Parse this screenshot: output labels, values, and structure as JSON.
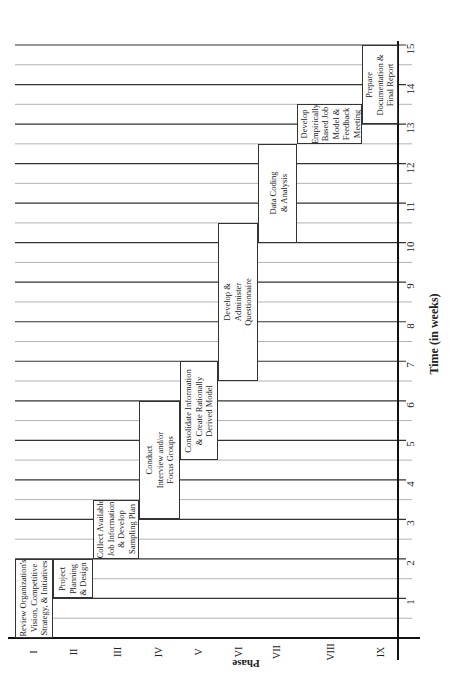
{
  "chart_data": {
    "type": "gantt",
    "orientation": "rotated 90° (time axis vertical on right, phases along bottom)",
    "title": "",
    "xlabel": "Phase",
    "ylabel": "Time (in weeks)",
    "time_range": [
      0,
      15
    ],
    "time_ticks": [
      "1",
      "2",
      "3",
      "4",
      "5",
      "6",
      "7",
      "8",
      "9",
      "10",
      "11",
      "12",
      "13",
      "14",
      "15"
    ],
    "grid": {
      "major_every_weeks": 1,
      "minor_every_weeks": 0.5
    },
    "categories": [
      "I",
      "II",
      "III",
      "IV",
      "V",
      "VI",
      "VII",
      "VIII",
      "IX"
    ],
    "tasks": [
      {
        "phase": "I",
        "label": "Review Organization's\nVision, Competitive\nStrategy, & Initiatives",
        "start": 0,
        "end": 2
      },
      {
        "phase": "II",
        "label": "Project\nPlanning\n& Design",
        "start": 1,
        "end": 2
      },
      {
        "phase": "III",
        "label": "Collect Available\nJob Information\n& Develop\nSampling Plan",
        "start": 2,
        "end": 3.5
      },
      {
        "phase": "IV",
        "label": "Conduct\nInterview and/or\nFocus Groups",
        "start": 3,
        "end": 6
      },
      {
        "phase": "V",
        "label": "Consolidate Information\n& Create Rationally\nDerived Model",
        "start": 4.5,
        "end": 7
      },
      {
        "phase": "VI",
        "label": "Develop &\nAdminister\nQuestionnaire",
        "start": 6.5,
        "end": 10.5
      },
      {
        "phase": "VII",
        "label": "Data Coding\n& Analysis",
        "start": 10,
        "end": 12.5
      },
      {
        "phase": "VIII",
        "label": "Develop\nEmpirically\nBased Job\nModel &\nFeedback\nMeeting",
        "start": 12.5,
        "end": 13.5
      },
      {
        "phase": "IX",
        "label": "Prepare\nDocumentation &\nFinal Report",
        "start": 13,
        "end": 15
      }
    ]
  },
  "axis": {
    "phase_title": "Phase",
    "time_title": "Time (in weeks)"
  }
}
